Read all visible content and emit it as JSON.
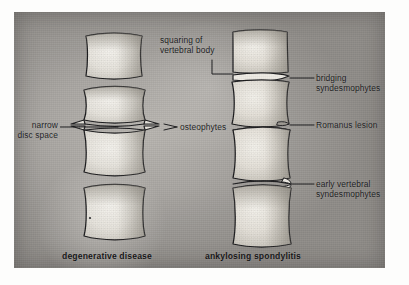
{
  "figure": {
    "plate_background": "#a9a6a2",
    "ink_color": "#1b1b1d"
  },
  "captions": [
    {
      "id": "left",
      "text": "degenerative disease"
    },
    {
      "id": "right",
      "text": "ankylosing spondylitis"
    }
  ],
  "labels": {
    "squaring": {
      "line1": "squaring of",
      "line2": "vertebral body"
    },
    "narrow_disc": {
      "line1": "narrow",
      "line2": "disc space"
    },
    "osteophytes": {
      "line1": "osteophytes"
    },
    "bridging": {
      "line1": "bridging",
      "line2": "syndesmophytes"
    },
    "romanus": {
      "line1": "Romanus lesion"
    },
    "early": {
      "line1": "early vertebral",
      "line2": "syndesmophytes"
    }
  },
  "columns": {
    "left": {
      "name": "degenerative-disease-column",
      "vertebra_count": 4,
      "features": [
        "narrow disc space",
        "osteophytes",
        "concave lateral margins"
      ]
    },
    "right": {
      "name": "ankylosing-spondylitis-column",
      "vertebra_count": 4,
      "features": [
        "squaring of vertebral body",
        "bridging syndesmophytes",
        "Romanus lesion",
        "early vertebral syndesmophytes"
      ]
    }
  }
}
